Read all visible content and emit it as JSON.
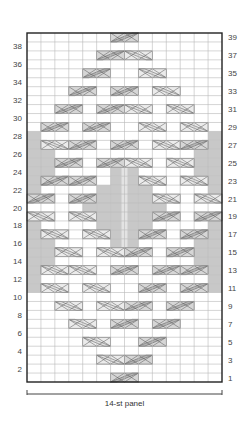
{
  "chart": {
    "panel_label": "14-st panel",
    "stitches": 14,
    "rows": 39,
    "colors": {
      "grid_line": "#b8b8b8",
      "border": "#222222",
      "panel_gray": "#c8c8c8",
      "cable_dark": "#b4b4b4",
      "cable_light": "#e2e2e2",
      "cable_line": "#555555",
      "center_stripe": "#e8e8e8"
    },
    "left_row_numbers": [
      "2",
      "4",
      "6",
      "8",
      "10",
      "12",
      "14",
      "16",
      "18",
      "20",
      "22",
      "24",
      "26",
      "28",
      "30",
      "32",
      "34",
      "36",
      "38"
    ],
    "right_row_numbers": [
      "1",
      "3",
      "5",
      "7",
      "9",
      "11",
      "13",
      "15",
      "17",
      "19",
      "21",
      "23",
      "25",
      "27",
      "29",
      "31",
      "33",
      "35",
      "37",
      "39"
    ],
    "cables": [
      {
        "row": 39,
        "col": 6,
        "shade": "dark"
      },
      {
        "row": 37,
        "col": 5,
        "shade": "dark"
      },
      {
        "row": 37,
        "col": 7,
        "shade": "light"
      },
      {
        "row": 35,
        "col": 4,
        "shade": "dark"
      },
      {
        "row": 35,
        "col": 8,
        "shade": "light"
      },
      {
        "row": 33,
        "col": 3,
        "shade": "dark"
      },
      {
        "row": 33,
        "col": 6,
        "shade": "dark"
      },
      {
        "row": 33,
        "col": 9,
        "shade": "light"
      },
      {
        "row": 31,
        "col": 2,
        "shade": "dark"
      },
      {
        "row": 31,
        "col": 5,
        "shade": "dark"
      },
      {
        "row": 31,
        "col": 7,
        "shade": "light"
      },
      {
        "row": 31,
        "col": 10,
        "shade": "light"
      },
      {
        "row": 29,
        "col": 1,
        "shade": "dark"
      },
      {
        "row": 29,
        "col": 4,
        "shade": "dark"
      },
      {
        "row": 29,
        "col": 8,
        "shade": "light"
      },
      {
        "row": 29,
        "col": 11,
        "shade": "light"
      },
      {
        "row": 27,
        "col": 1,
        "shade": "light"
      },
      {
        "row": 27,
        "col": 3,
        "shade": "dark"
      },
      {
        "row": 27,
        "col": 6,
        "shade": "dark"
      },
      {
        "row": 27,
        "col": 9,
        "shade": "light"
      },
      {
        "row": 27,
        "col": 11,
        "shade": "dark"
      },
      {
        "row": 25,
        "col": 2,
        "shade": "dark"
      },
      {
        "row": 25,
        "col": 5,
        "shade": "dark"
      },
      {
        "row": 25,
        "col": 7,
        "shade": "light"
      },
      {
        "row": 25,
        "col": 10,
        "shade": "light"
      },
      {
        "row": 23,
        "col": 1,
        "shade": "dark"
      },
      {
        "row": 23,
        "col": 3,
        "shade": "dark"
      },
      {
        "row": 23,
        "col": 8,
        "shade": "light"
      },
      {
        "row": 23,
        "col": 11,
        "shade": "light"
      },
      {
        "row": 21,
        "col": 0,
        "shade": "dark"
      },
      {
        "row": 21,
        "col": 3,
        "shade": "dark"
      },
      {
        "row": 21,
        "col": 9,
        "shade": "light"
      },
      {
        "row": 21,
        "col": 12,
        "shade": "light"
      },
      {
        "row": 19,
        "col": 0,
        "shade": "light"
      },
      {
        "row": 19,
        "col": 3,
        "shade": "light"
      },
      {
        "row": 19,
        "col": 9,
        "shade": "dark"
      },
      {
        "row": 19,
        "col": 12,
        "shade": "dark"
      },
      {
        "row": 17,
        "col": 1,
        "shade": "light"
      },
      {
        "row": 17,
        "col": 4,
        "shade": "light"
      },
      {
        "row": 17,
        "col": 8,
        "shade": "dark"
      },
      {
        "row": 17,
        "col": 11,
        "shade": "dark"
      },
      {
        "row": 15,
        "col": 2,
        "shade": "light"
      },
      {
        "row": 15,
        "col": 5,
        "shade": "light"
      },
      {
        "row": 15,
        "col": 7,
        "shade": "dark"
      },
      {
        "row": 15,
        "col": 10,
        "shade": "dark"
      },
      {
        "row": 13,
        "col": 1,
        "shade": "light"
      },
      {
        "row": 13,
        "col": 3,
        "shade": "light"
      },
      {
        "row": 13,
        "col": 6,
        "shade": "dark"
      },
      {
        "row": 13,
        "col": 9,
        "shade": "dark"
      },
      {
        "row": 13,
        "col": 11,
        "shade": "dark"
      },
      {
        "row": 11,
        "col": 1,
        "shade": "light"
      },
      {
        "row": 11,
        "col": 4,
        "shade": "light"
      },
      {
        "row": 11,
        "col": 8,
        "shade": "dark"
      },
      {
        "row": 11,
        "col": 11,
        "shade": "dark"
      },
      {
        "row": 9,
        "col": 2,
        "shade": "light"
      },
      {
        "row": 9,
        "col": 5,
        "shade": "light"
      },
      {
        "row": 9,
        "col": 7,
        "shade": "dark"
      },
      {
        "row": 9,
        "col": 10,
        "shade": "dark"
      },
      {
        "row": 7,
        "col": 3,
        "shade": "light"
      },
      {
        "row": 7,
        "col": 6,
        "shade": "dark"
      },
      {
        "row": 7,
        "col": 9,
        "shade": "dark"
      },
      {
        "row": 5,
        "col": 4,
        "shade": "light"
      },
      {
        "row": 5,
        "col": 8,
        "shade": "dark"
      },
      {
        "row": 3,
        "col": 5,
        "shade": "light"
      },
      {
        "row": 3,
        "col": 7,
        "shade": "dark"
      },
      {
        "row": 1,
        "col": 6,
        "shade": "dark"
      }
    ],
    "gray_cells": [
      {
        "row": 28,
        "cols": [
          0,
          13
        ]
      },
      {
        "row": 27,
        "cols": [
          0,
          13
        ]
      },
      {
        "row": 26,
        "cols": [
          0,
          1,
          12,
          13
        ]
      },
      {
        "row": 25,
        "cols": [
          0,
          1,
          12,
          13
        ]
      },
      {
        "row": 24,
        "cols": [
          0,
          1,
          6,
          7,
          12,
          13
        ]
      },
      {
        "row": 23,
        "cols": [
          0,
          6,
          7,
          13
        ]
      },
      {
        "row": 22,
        "cols": [
          0,
          5,
          6,
          7,
          8,
          13
        ]
      },
      {
        "row": 21,
        "cols": [
          5,
          6,
          7,
          8
        ]
      },
      {
        "row": 20,
        "cols": [
          4,
          5,
          6,
          7,
          8,
          9
        ]
      },
      {
        "row": 19,
        "cols": [
          5,
          6,
          7,
          8
        ]
      },
      {
        "row": 18,
        "cols": [
          0,
          5,
          6,
          7,
          8,
          13
        ]
      },
      {
        "row": 17,
        "cols": [
          0,
          6,
          7,
          13
        ]
      },
      {
        "row": 16,
        "cols": [
          0,
          1,
          6,
          7,
          12,
          13
        ]
      },
      {
        "row": 15,
        "cols": [
          0,
          1,
          12,
          13
        ]
      },
      {
        "row": 14,
        "cols": [
          0,
          1,
          12,
          13
        ]
      },
      {
        "row": 13,
        "cols": [
          0,
          13
        ]
      },
      {
        "row": 12,
        "cols": [
          0,
          13
        ]
      },
      {
        "row": 11,
        "cols": [
          0,
          13
        ]
      }
    ],
    "center_stripe": {
      "from_row": 16,
      "to_row": 24,
      "col_boundary": 7
    }
  }
}
